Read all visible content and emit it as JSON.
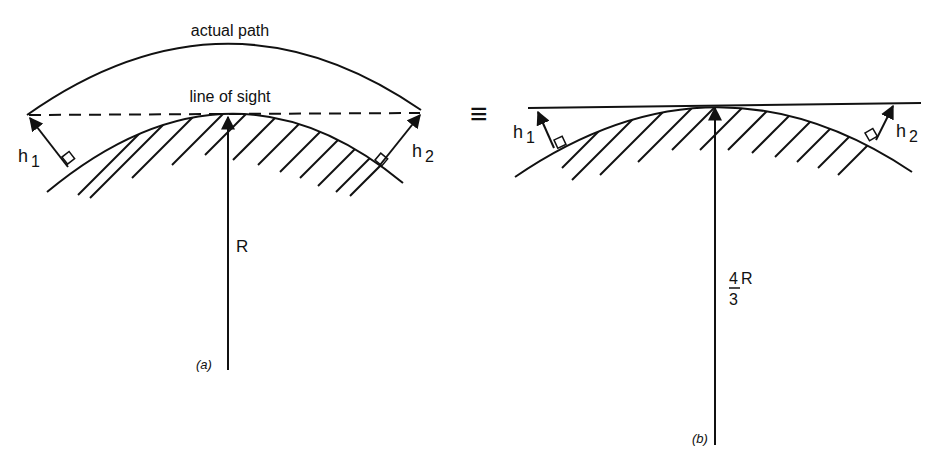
{
  "panel_a": {
    "actual_path_label": "actual path",
    "line_of_sight_label": "line of sight",
    "h1_base": "h",
    "h1_sub": "1",
    "h2_base": "h",
    "h2_sub": "2",
    "radius_label": "R",
    "caption": "(a)"
  },
  "equivalence_symbol": "≡",
  "panel_b": {
    "h1_base": "h",
    "h1_sub": "1",
    "h2_base": "h",
    "h2_sub": "2",
    "radius_numerator": "4",
    "radius_denominator": "3",
    "radius_symbol": "R",
    "caption": "(b)"
  },
  "colors": {
    "ink": "#111111",
    "background": "#ffffff"
  }
}
